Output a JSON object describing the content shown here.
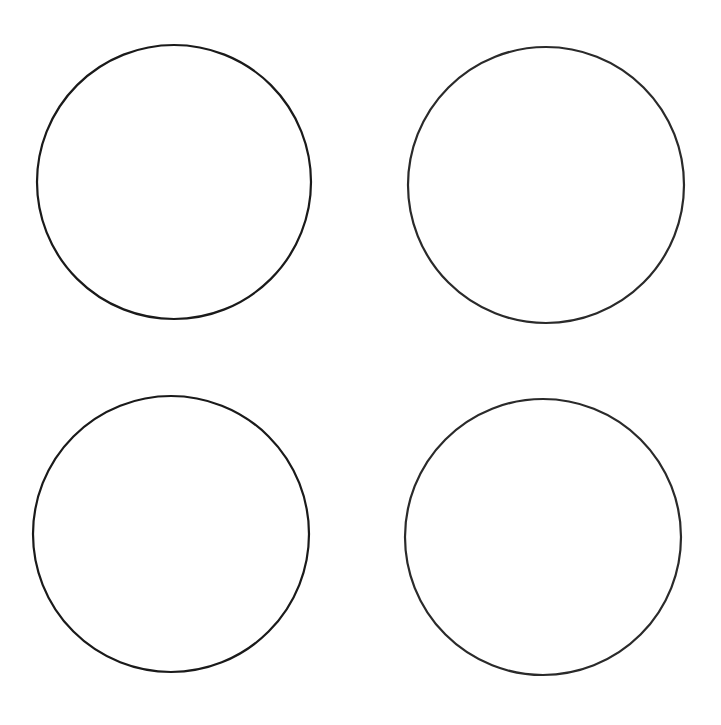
{
  "canvas": {
    "width": 721,
    "height": 725,
    "background": "#ffffff"
  },
  "shapes": [
    {
      "id": "circle-top-left",
      "type": "circle",
      "cx": 174,
      "cy": 182,
      "r": 137,
      "stroke": "#1a1a1a",
      "stroke_width": 2.2,
      "fill": "none"
    },
    {
      "id": "circle-top-right",
      "type": "circle",
      "cx": 546,
      "cy": 185,
      "r": 138,
      "stroke": "#2a2a2a",
      "stroke_width": 2.2,
      "fill": "none"
    },
    {
      "id": "circle-bottom-left",
      "type": "circle",
      "cx": 171,
      "cy": 534,
      "r": 138,
      "stroke": "#1a1a1a",
      "stroke_width": 2.2,
      "fill": "none"
    },
    {
      "id": "circle-bottom-right",
      "type": "circle",
      "cx": 543,
      "cy": 537,
      "r": 138,
      "stroke": "#2a2a2a",
      "stroke_width": 2.2,
      "fill": "none"
    }
  ]
}
